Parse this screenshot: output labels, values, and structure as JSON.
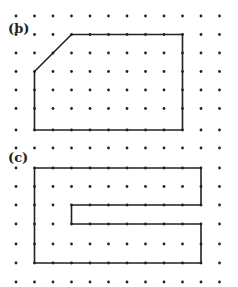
{
  "figure": {
    "width": 238,
    "height": 287,
    "grid": {
      "columns_x": [
        16,
        34.5,
        53,
        71.5,
        90,
        108.5,
        127,
        145.5,
        164,
        182.5,
        201,
        219.5
      ],
      "rows_y": [
        16,
        34.5,
        53,
        71.5,
        90,
        108.5,
        130,
        148,
        168,
        186.5,
        205,
        224,
        244,
        263,
        282
      ],
      "dot_color": "#222222",
      "dot_radius": 1.4
    },
    "line_color": "#222222",
    "shapes": [
      {
        "id": "b",
        "label": "(b)",
        "label_pos": [
          8,
          33
        ],
        "vertices_grid": [
          [
            1,
            3
          ],
          [
            3,
            1
          ],
          [
            9,
            1
          ],
          [
            9,
            6
          ],
          [
            1,
            6
          ]
        ]
      },
      {
        "id": "c",
        "label": "(c)",
        "label_pos": [
          8,
          162
        ],
        "vertices_grid": [
          [
            1,
            8
          ],
          [
            10,
            8
          ],
          [
            10,
            10
          ],
          [
            3,
            10
          ],
          [
            3,
            11
          ],
          [
            10,
            11
          ],
          [
            10,
            13
          ],
          [
            1,
            13
          ]
        ]
      }
    ]
  }
}
